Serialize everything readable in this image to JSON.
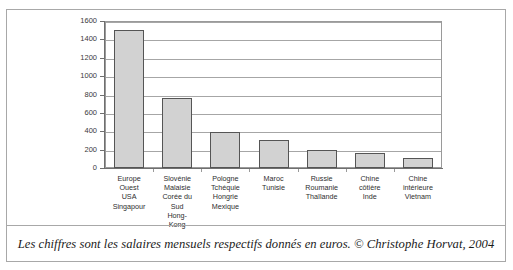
{
  "figure": {
    "top_cut_text": "",
    "caption": "Les chiffres sont les salaires mensuels respectifs donnés en euros. © Christophe Horvat, 2004"
  },
  "chart_data": {
    "type": "bar",
    "title": "",
    "xlabel": "",
    "ylabel": "",
    "ylim": [
      0,
      1600
    ],
    "yticks": [
      0,
      200,
      400,
      600,
      800,
      1000,
      1200,
      1400,
      1600
    ],
    "ytick_labels": [
      "0",
      "200",
      "400",
      "600",
      "800",
      "1000",
      "1200",
      "1400",
      "1600"
    ],
    "grid": true,
    "legend": "none",
    "unit": "euros",
    "categories": [
      "Europe Ouest USA Singapour",
      "Slovénie Malaisie Corée du Sud Hong-Kong",
      "Pologne Tchéquie Hongrie Mexique",
      "Maroc Tunisie",
      "Russie Roumanie Thaïlande",
      "Chine côtière Inde",
      "Chine intérieure Vietnam"
    ],
    "category_lines": [
      [
        "Europe",
        "Ouest",
        "USA",
        "Singapour"
      ],
      [
        "Slovénie",
        "Malaisie",
        "Corée du",
        "Sud",
        "Hong-",
        "Kong"
      ],
      [
        "Pologne",
        "Tchéquie",
        "Hongrie",
        "Mexique"
      ],
      [
        "Maroc",
        "Tunisie"
      ],
      [
        "Russie",
        "Roumanie",
        "Thaïlande"
      ],
      [
        "Chine",
        "côtière",
        "Inde"
      ],
      [
        "Chine",
        "intérieure",
        "Vietnam"
      ]
    ],
    "values": [
      1500,
      760,
      390,
      300,
      200,
      160,
      110
    ],
    "colors": {
      "bar_fill": "#d2d2d2",
      "bar_border": "#555555",
      "gridline": "#a6a6a6",
      "axis": "#6f6f6f",
      "frame": "#a8a8a8",
      "text": "#2e2e2e"
    }
  }
}
